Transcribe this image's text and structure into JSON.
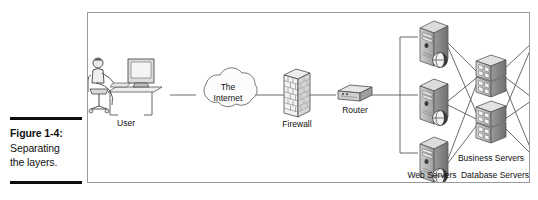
{
  "caption": {
    "figure_label": "Figure 1-4:",
    "line2": "Separating",
    "line3": "the layers."
  },
  "diagram": {
    "title": "Separating the layers",
    "nodes": {
      "user": "User",
      "internet_line1": "The",
      "internet_line2": "Internet",
      "firewall": "Firewall",
      "router": "Router",
      "web_servers": "Web Servers",
      "business_servers": "Business Servers",
      "database_servers": "Database Servers"
    },
    "counts": {
      "web_servers": 3,
      "business_servers": 2,
      "database_servers": 3
    },
    "colors": {
      "line": "#4a4a4a",
      "frame": "#9a9a9a",
      "fill_light": "#e8e8e8",
      "fill_mid": "#bdbdbd",
      "fill_dark": "#8c8c8c",
      "text": "#111111",
      "rule": "#0d0d0d"
    },
    "flow": [
      "User",
      "The Internet",
      "Firewall",
      "Router",
      "Web Servers",
      "Business Servers",
      "Database Servers"
    ]
  }
}
